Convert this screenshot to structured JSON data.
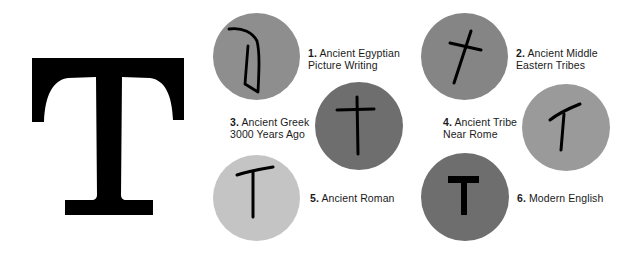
{
  "title_letter": "T",
  "colors": {
    "background": "#ffffff",
    "glyph": "#000000",
    "label_text": "#1a1a1a"
  },
  "stages": [
    {
      "number": "1.",
      "line1": "Ancient Egyptian",
      "line2": "Picture Writing",
      "circle_color": "#8e8e8e"
    },
    {
      "number": "2.",
      "line1": "Ancient Middle",
      "line2": "Eastern Tribes",
      "circle_color": "#858585"
    },
    {
      "number": "3.",
      "line1": "Ancient Greek",
      "line2": "3000 Years Ago",
      "circle_color": "#6e6e6e"
    },
    {
      "number": "4.",
      "line1": "Ancient Tribe",
      "line2": "Near Rome",
      "circle_color": "#9a9a9a"
    },
    {
      "number": "5.",
      "line1": "Ancient Roman",
      "line2": "",
      "circle_color": "#c4c4c4"
    },
    {
      "number": "6.",
      "line1": "Modern English",
      "line2": "",
      "circle_color": "#6e6e6e"
    }
  ]
}
